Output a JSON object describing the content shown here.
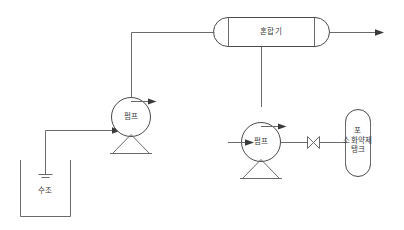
{
  "diagram": {
    "background_color": "#ffffff",
    "line_color": "#6b6b6b",
    "text_color": "#3c3c3c",
    "equipment": {
      "mixer": {
        "label": "혼합기",
        "shape": "horizontal-capsule-vessel"
      },
      "pump_water": {
        "label": "펌프",
        "shape": "circle-on-pedestal"
      },
      "pump_foam": {
        "label": "펌프",
        "shape": "circle-on-pedestal"
      },
      "water_tank": {
        "label": "수조",
        "shape": "open-top-rectangular-tank"
      },
      "foam_tank": {
        "label_line_1": "포",
        "label_line_2": "소화약제",
        "label_line_3": "탱크",
        "shape": "vertical-rounded-tank"
      },
      "valve": {
        "label": "",
        "shape": "gate-valve-bowtie"
      }
    },
    "flow_arrows": [
      {
        "name": "water-pump-suction",
        "direction": "right"
      },
      {
        "name": "water-pump-discharge",
        "direction": "right"
      },
      {
        "name": "foam-pump-suction",
        "direction": "right"
      },
      {
        "name": "foam-pump-discharge",
        "direction": "right"
      },
      {
        "name": "mixer-outlet",
        "direction": "right"
      }
    ],
    "connections": [
      {
        "from": "수조",
        "to": "펌프",
        "type": "suction-line"
      },
      {
        "from": "펌프",
        "to": "혼합기",
        "type": "water-discharge-line"
      },
      {
        "from": "포 소화약제 탱크",
        "to": "펌프",
        "type": "foam-suction-line"
      },
      {
        "from": "펌프",
        "to": "혼합기",
        "type": "foam-discharge-line"
      },
      {
        "from": "혼합기",
        "to": "방출구",
        "type": "mixed-solution-outlet"
      }
    ]
  }
}
